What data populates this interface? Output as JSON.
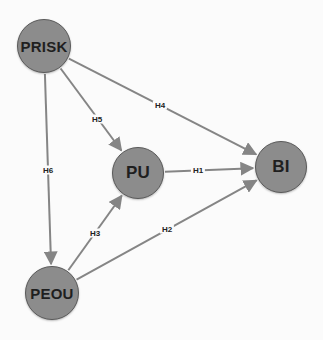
{
  "diagram": {
    "type": "path-model",
    "colors": {
      "node_fill": "#8c8c8c",
      "node_border": "#5a5a5a",
      "node_text": "#1f1f1f",
      "edge": "#858585",
      "label_text": "#222222",
      "background": "#fbfbfb"
    },
    "nodes": [
      {
        "id": "PRISK",
        "label": "PRISK",
        "cx": 44,
        "cy": 46,
        "r": 27
      },
      {
        "id": "PU",
        "label": "PU",
        "cx": 138,
        "cy": 173,
        "r": 26
      },
      {
        "id": "BI",
        "label": "BI",
        "cx": 281,
        "cy": 167,
        "r": 26
      },
      {
        "id": "PEOU",
        "label": "PEOU",
        "cx": 52,
        "cy": 293,
        "r": 27
      }
    ],
    "edges": [
      {
        "id": "H1",
        "label": "H1",
        "from": "PU",
        "to": "BI",
        "lx": 198,
        "ly": 170
      },
      {
        "id": "H2",
        "label": "H2",
        "from": "PEOU",
        "to": "BI",
        "lx": 167,
        "ly": 229
      },
      {
        "id": "H3",
        "label": "H3",
        "from": "PEOU",
        "to": "PU",
        "lx": 95,
        "ly": 233
      },
      {
        "id": "H4",
        "label": "H4",
        "from": "PRISK",
        "to": "BI",
        "lx": 160,
        "ly": 105
      },
      {
        "id": "H5",
        "label": "H5",
        "from": "PRISK",
        "to": "PU",
        "lx": 97,
        "ly": 119
      },
      {
        "id": "H6",
        "label": "H6",
        "from": "PRISK",
        "to": "PEOU",
        "lx": 48,
        "ly": 170
      }
    ]
  }
}
